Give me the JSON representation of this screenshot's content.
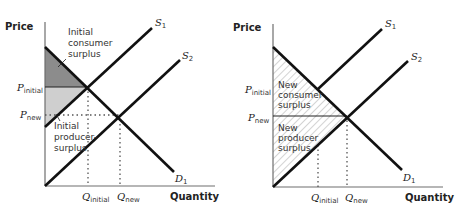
{
  "left_panel": {
    "y_axis_label": "Price",
    "x_axis_label": "Quantity",
    "p_initial": {
      "main": "P",
      "sub": "initial"
    },
    "p_new": {
      "main": "P",
      "sub": "new"
    },
    "q_initial": {
      "main": "Q",
      "sub": "initial"
    },
    "q_new": {
      "main": "Q",
      "sub": "new"
    },
    "s1": {
      "main": "S",
      "sub": "1"
    },
    "s2": {
      "main": "S",
      "sub": "2"
    },
    "d1": {
      "main": "D",
      "sub": "1"
    },
    "consumer_surplus_label": [
      "Initial",
      "consumer",
      "surplus"
    ],
    "producer_surplus_label": [
      "Initial",
      "producer-",
      "surplus"
    ]
  },
  "right_panel": {
    "y_axis_label": "Price",
    "x_axis_label": "Quantity",
    "p_initial": {
      "main": "P",
      "sub": "initial"
    },
    "p_new": {
      "main": "P",
      "sub": "new"
    },
    "q_initial": {
      "main": "Q",
      "sub": "initial"
    },
    "q_new": {
      "main": "Q",
      "sub": "new"
    },
    "s1": {
      "main": "S",
      "sub": "1"
    },
    "s2": {
      "main": "S",
      "sub": "2"
    },
    "d1": {
      "main": "D",
      "sub": "1"
    },
    "consumer_surplus_label": [
      "New",
      "consumer",
      "surplus"
    ],
    "producer_surplus_label": [
      "New",
      "producer",
      "surplus"
    ]
  },
  "colors": {
    "consumer_surplus_fill": "#8c8c8c",
    "producer_surplus_fill": "#cfcfcf",
    "hatch": "#b5b5b5",
    "curve": "#111111"
  }
}
